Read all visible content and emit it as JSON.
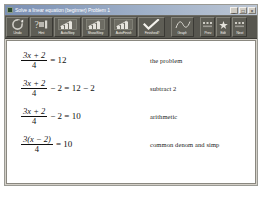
{
  "window": {
    "title": "Solve a linear equation (beginner)  Problem 1",
    "icon": "app-icon",
    "controls": [
      {
        "name": "minimize",
        "glyph": "_"
      },
      {
        "name": "maximize",
        "glyph": "□"
      },
      {
        "name": "close",
        "glyph": "×"
      }
    ]
  },
  "toolbar": {
    "buttons": [
      {
        "label": "Undo",
        "icon": "undo-arrow-icon",
        "width": "w-mid"
      },
      {
        "label": "Hint",
        "icon": "hint-question-icon",
        "width": "w-mid"
      },
      {
        "label": "AutoStep",
        "icon": "autostep-chart-icon",
        "width": "w-wide"
      },
      {
        "label": "ShowStep",
        "icon": "showstep-chart-icon",
        "width": "w-wide"
      },
      {
        "label": "AutoFinish",
        "icon": "autofinish-chart-icon",
        "width": "w-wide"
      },
      {
        "label": "Finished?",
        "icon": "checkmark-icon",
        "width": "w-wide"
      },
      {
        "label": "Graph",
        "icon": "graph-curve-icon",
        "width": "w-mid"
      },
      {
        "label": "Prev",
        "icon": "prev-icon",
        "width": "w-narrow"
      },
      {
        "label": "Edit",
        "icon": "edit-star-icon",
        "width": "w-narrow"
      },
      {
        "label": "Next",
        "icon": "next-icon",
        "width": "w-narrow"
      }
    ]
  },
  "steps": [
    {
      "numerator": "3x + 2",
      "denominator": "4",
      "tail": "= 12",
      "annotation": "the problem"
    },
    {
      "numerator": "3x + 2",
      "denominator": "4",
      "tail": "− 2 = 12 − 2",
      "annotation": "subtract 2"
    },
    {
      "numerator": "3x + 2",
      "denominator": "4",
      "tail": "− 2 = 10",
      "annotation": "arithmetic"
    },
    {
      "numerator": "3(x − 2)",
      "denominator": "4",
      "tail": "= 10",
      "annotation": "common denom and simp"
    }
  ]
}
